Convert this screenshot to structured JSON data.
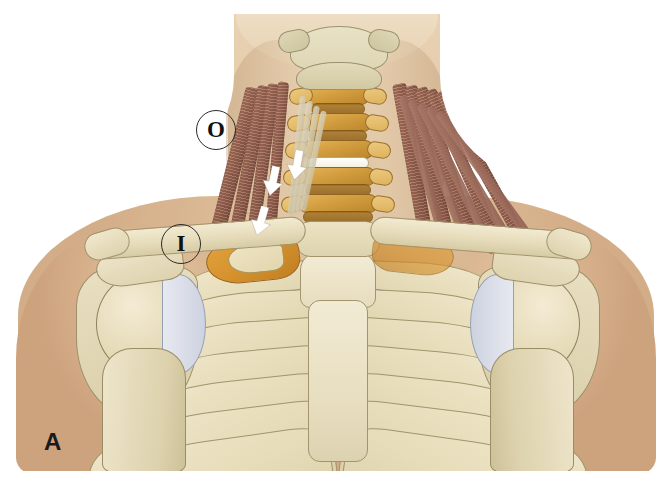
{
  "figure": {
    "panel_label": "A",
    "markers": [
      {
        "id": "origin",
        "text": "O",
        "meaning": "origin-marker"
      },
      {
        "id": "insertion",
        "text": "I",
        "meaning": "insertion-marker"
      }
    ],
    "background_color": "#ffffff",
    "skin_color": "#dcbb97",
    "bone_color": "#e6dbb7",
    "cartilage_color": "#c3c8d6",
    "vertebra_color": "#d29d3e",
    "muscle_color": "#9c6753",
    "highlight_rib_color": "#d4902c",
    "arrow_color": "#ffffff",
    "marker_outline_color": "#2b2b2b"
  },
  "anatomy": {
    "regions": [
      {
        "name": "neck",
        "label": "neck"
      },
      {
        "name": "cervical-spine",
        "label": "cervical vertebrae"
      },
      {
        "name": "clavicle-left",
        "label": "left clavicle"
      },
      {
        "name": "clavicle-right",
        "label": "right clavicle"
      },
      {
        "name": "sternum",
        "label": "sternum"
      },
      {
        "name": "rib-cage",
        "label": "rib cage"
      },
      {
        "name": "first-rib",
        "label": "first rib"
      },
      {
        "name": "scalene-muscles",
        "label": "scalene muscles"
      },
      {
        "name": "shoulder-left",
        "label": "left shoulder"
      },
      {
        "name": "shoulder-right",
        "label": "right shoulder"
      }
    ],
    "rib_count_visible": 7,
    "cervical_vertebrae_visible": 5,
    "arrow_count": 3
  }
}
